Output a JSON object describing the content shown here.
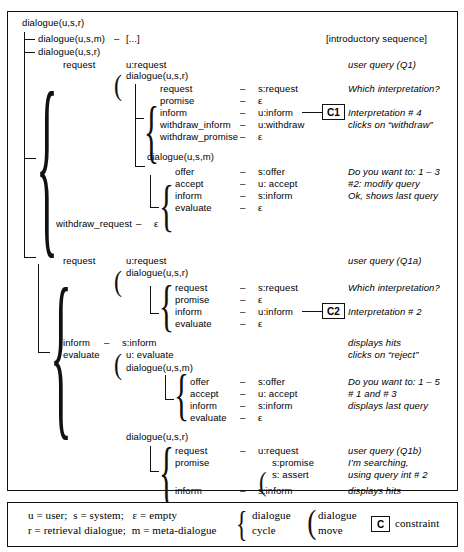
{
  "diagram": {
    "title_root": "dialogue(u,s,r)",
    "rows": [
      {
        "id": "r0",
        "label": "dialogue(u,s,r)",
        "dash": "",
        "value": "",
        "note": ""
      },
      {
        "id": "r1",
        "label": "dialogue(u,s,m)",
        "dash": "–",
        "value": "[...]",
        "note": "[introductory sequence]"
      },
      {
        "id": "r2",
        "label": "dialogue(u,s,r)",
        "dash": "",
        "value": "",
        "note": ""
      },
      {
        "id": "r3",
        "label": "request",
        "dash": "",
        "value": "u:request",
        "note": "user query (Q1)"
      },
      {
        "id": "r4",
        "label": "",
        "dash": "",
        "value": "dialogue(u,s,r)",
        "note": ""
      },
      {
        "id": "r5",
        "label": "request",
        "dash": "–",
        "value": "s:request",
        "note": "Which interpretation?"
      },
      {
        "id": "r6",
        "label": "promise",
        "dash": "–",
        "value": "ε",
        "note": ""
      },
      {
        "id": "r7",
        "label": "inform",
        "dash": "–",
        "value": "u:inform",
        "note": "Interpretation # 4",
        "constraint": "C1"
      },
      {
        "id": "r8",
        "label": "withdraw_inform",
        "dash": "–",
        "value": "u:withdraw",
        "note": "clicks on “withdraw”"
      },
      {
        "id": "r9",
        "label": "withdraw_promise",
        "dash": "–",
        "value": "ε",
        "note": ""
      },
      {
        "id": "r10",
        "label": "dialogue(u,s,m)",
        "dash": "",
        "value": "",
        "note": ""
      },
      {
        "id": "r11",
        "label": "offer",
        "dash": "–",
        "value": "s:offer",
        "note": "Do you want to: 1 – 3"
      },
      {
        "id": "r12",
        "label": "accept",
        "dash": "–",
        "value": "u: accept",
        "note": "#2: modify query"
      },
      {
        "id": "r13",
        "label": "inform",
        "dash": "–",
        "value": "s:inform",
        "note": "Ok, shows last query"
      },
      {
        "id": "r14",
        "label": "evaluate",
        "dash": "–",
        "value": "ε",
        "note": ""
      },
      {
        "id": "r15",
        "label": "withdraw_request",
        "dash": "–",
        "value": "ε",
        "note": ""
      },
      {
        "id": "r16",
        "label": "request",
        "dash": "",
        "value": "u:request",
        "note": "user query (Q1a)"
      },
      {
        "id": "r17",
        "label": "",
        "dash": "",
        "value": "dialogue(u,s,r)",
        "note": ""
      },
      {
        "id": "r18",
        "label": "request",
        "dash": "–",
        "value": "s:request",
        "note": "Which interpretation?"
      },
      {
        "id": "r19",
        "label": "promise",
        "dash": "–",
        "value": "ε",
        "note": ""
      },
      {
        "id": "r20",
        "label": "inform",
        "dash": "–",
        "value": "u:inform",
        "note": "Interpretation # 2",
        "constraint": "C2"
      },
      {
        "id": "r21",
        "label": "evaluate",
        "dash": "–",
        "value": "ε",
        "note": ""
      },
      {
        "id": "r22",
        "label": "inform",
        "dash": "–",
        "value": "s:inform",
        "note": "displays hits"
      },
      {
        "id": "r23",
        "label": "evaluate",
        "dash": "",
        "value": "u: evaluate",
        "note": "clicks on “reject”"
      },
      {
        "id": "r24",
        "label": "",
        "dash": "",
        "value": "dialogue(u,s,m)",
        "note": ""
      },
      {
        "id": "r25",
        "label": "offer",
        "dash": "–",
        "value": "s:offer",
        "note": "Do you want to: 1 – 5"
      },
      {
        "id": "r26",
        "label": "accept",
        "dash": "–",
        "value": "u: accept",
        "note": "# 1 and # 3"
      },
      {
        "id": "r27",
        "label": "inform",
        "dash": "–",
        "value": "s:inform",
        "note": "displays last query"
      },
      {
        "id": "r28",
        "label": "evaluate",
        "dash": "–",
        "value": "ε",
        "note": ""
      },
      {
        "id": "r29",
        "label": "dialogue(u,s,r)",
        "dash": "",
        "value": "",
        "note": ""
      },
      {
        "id": "r30",
        "label": "request",
        "dash": "–",
        "value": "u:request",
        "note": "user query (Q1b)"
      },
      {
        "id": "r31",
        "label": "promise",
        "dash": "",
        "value": "s:promise",
        "note": "I’m searching,"
      },
      {
        "id": "r32",
        "label": "",
        "dash": "",
        "value": "s: assert",
        "note": "using query int # 2"
      },
      {
        "id": "r33",
        "label": "inform",
        "dash": "–",
        "value": "s:inform",
        "note": "displays hits"
      },
      {
        "id": "r34",
        "label": "...",
        "dash": "",
        "value": "",
        "note": "..."
      }
    ],
    "constraints": [
      {
        "id": "C1",
        "label": "C1"
      },
      {
        "id": "C2",
        "label": "C2"
      }
    ]
  },
  "legend": {
    "line1": "u = user;  s = system;   ε = empty",
    "line2": "r = retrieval dialogue;  m = meta-dialogue",
    "cycle_line1": "dialogue",
    "cycle_line2": "cycle",
    "move_line1": "dialogue",
    "move_line2": "move",
    "constraint_box": "C",
    "constraint_label": "constraint"
  },
  "colors": {
    "ink": "#111111",
    "background": "#ffffff"
  }
}
